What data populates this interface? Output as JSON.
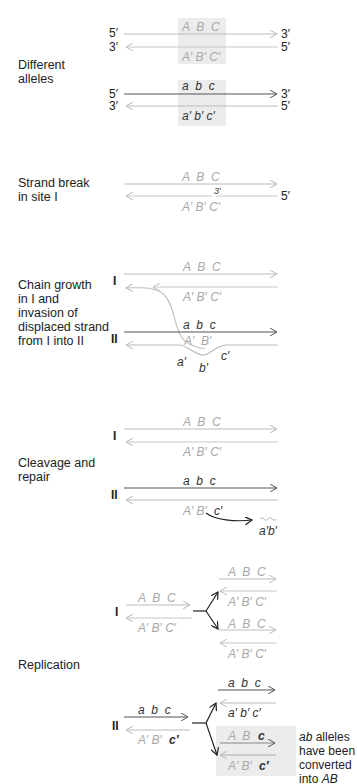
{
  "colors": {
    "dark_strand": "#555555",
    "light_strand": "#bdbdbd",
    "shade": "#ececec",
    "text": "#222222",
    "light_text": "#a8a8a8"
  },
  "sections": {
    "different_alleles": {
      "label_line1": "Different",
      "label_line2": "alleles",
      "top": {
        "five": "5′",
        "three": "3′",
        "three_b": "3′",
        "five_b": "5′",
        "top_genes": "A  B  C",
        "bottom_genes": "A′ B′ C′"
      },
      "bottom": {
        "five": "5′",
        "three": "3′",
        "three_b": "3′",
        "five_b": "5′",
        "top_genes": "a  b  c",
        "bottom_genes": "a′ b′ c′"
      }
    },
    "strand_break": {
      "label_line1": "Strand break",
      "label_line2": "in site I",
      "top_genes": "A  B  C",
      "break_end": "3′",
      "five": "5′",
      "bottom_genes": "A′ B′ C′"
    },
    "chain_growth": {
      "label_lines": [
        "Chain growth",
        "in I and",
        "invasion of",
        "displaced strand",
        "from I into II"
      ],
      "site_I": "I",
      "site_II": "II",
      "I_top_genes": "A  B  C",
      "I_bottom_genes": "A′ B′ C′",
      "II_top_genes": "a  b  c",
      "invaded_genes": "A′  B′",
      "loop_a": "a′",
      "loop_b": "b′",
      "loop_c": "c′"
    },
    "cleavage": {
      "label_line1": "Cleavage and",
      "label_line2": "repair",
      "site_I": "I",
      "site_II": "II",
      "I_top_genes": "A  B  C",
      "I_bottom_genes": "A′ B′ C′",
      "II_top_genes": "a  b  c",
      "II_bottom_light": "A′ B′",
      "II_bottom_dark": "c′",
      "excised": "a′b′"
    },
    "replication": {
      "label": "Replication",
      "site_I": "I",
      "site_II": "II",
      "I_parent_top": "A  B  C",
      "I_parent_bottom": "A′ B′ C′",
      "I_d1_top": "A  B  C",
      "I_d1_bottom": "A′ B′ C′",
      "I_d2_top": "A  B  C",
      "I_d2_bottom": "A′ B′ C′",
      "II_parent_top": "a  b  c",
      "II_parent_bottom_light": "A′ B′",
      "II_parent_bottom_dark": "c′",
      "II_d1_top": "a  b  c",
      "II_d1_bottom": "a′ b′ c′",
      "II_d2_top_light": "A  B",
      "II_d2_top_dark": "c",
      "II_d2_bottom_light": "A′ B′",
      "II_d2_bottom_dark": "c′",
      "note_em": "ab",
      "note_line1": " alleles",
      "note_line2": "have been",
      "note_line3": "converted",
      "note_line4": "into ",
      "note_em2": "AB"
    }
  }
}
